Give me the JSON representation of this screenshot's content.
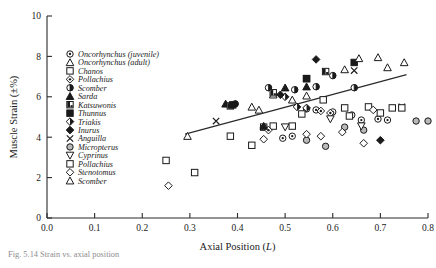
{
  "figure": {
    "caption": "Fig. 5.14  Strain vs. axial position"
  },
  "chart_data": {
    "type": "scatter",
    "title": "",
    "xlabel": "Axial Position (L)",
    "ylabel": "Muscle Strain (±%)",
    "xlim": [
      0.0,
      0.8
    ],
    "ylim": [
      0,
      10
    ],
    "xticks": [
      "0.0",
      "0.1",
      "0.2",
      "0.3",
      "0.4",
      "0.5",
      "0.6",
      "0.7",
      "0.8"
    ],
    "xtick_values": [
      0.0,
      0.1,
      0.2,
      0.3,
      0.4,
      0.5,
      0.6,
      0.7,
      0.8
    ],
    "yticks": [
      "0",
      "2",
      "4",
      "6",
      "8",
      "10"
    ],
    "ytick_values": [
      0,
      2,
      4,
      6,
      8,
      10
    ],
    "grid": false,
    "legend_position": "upper-left-inside",
    "trendline": {
      "label": "linear regression",
      "x_start": 0.29,
      "y_start": 4.15,
      "x_end": 0.755,
      "y_end": 7.1
    },
    "series": [
      {
        "name": "Oncorhynchus (juvenile)",
        "marker": "circle-dot",
        "points": [
          [
            0.495,
            3.95
          ],
          [
            0.515,
            4.05
          ],
          [
            0.545,
            5.4
          ],
          [
            0.565,
            5.35
          ],
          [
            0.6,
            5.25
          ],
          [
            0.64,
            5.1
          ],
          [
            0.66,
            4.85
          ],
          [
            0.695,
            4.9
          ],
          [
            0.715,
            4.85
          ]
        ]
      },
      {
        "name": "Oncorhynchus (adult)",
        "marker": "triangle-open",
        "points": [
          [
            0.295,
            4.05
          ],
          [
            0.43,
            5.5
          ],
          [
            0.475,
            6.1
          ],
          [
            0.545,
            6.05
          ],
          [
            0.625,
            7.35
          ],
          [
            0.695,
            7.95
          ],
          [
            0.75,
            7.7
          ]
        ]
      },
      {
        "name": "Chanos",
        "marker": "square-open",
        "points": [
          [
            0.25,
            2.85
          ],
          [
            0.31,
            2.25
          ],
          [
            0.385,
            4.05
          ],
          [
            0.455,
            4.5
          ],
          [
            0.475,
            4.55
          ],
          [
            0.535,
            5.15
          ],
          [
            0.58,
            5.85
          ],
          [
            0.625,
            5.45
          ],
          [
            0.675,
            5.5
          ],
          [
            0.725,
            5.45
          ]
        ]
      },
      {
        "name": "Pollachius",
        "marker": "diamond-dot",
        "points": [
          [
            0.455,
            4.5
          ],
          [
            0.465,
            4.35
          ],
          [
            0.575,
            5.3
          ],
          [
            0.595,
            5.2
          ]
        ]
      },
      {
        "name": "Scomber",
        "marker": "half-circle",
        "points": [
          [
            0.395,
            5.65
          ],
          [
            0.465,
            6.45
          ],
          [
            0.52,
            6.35
          ],
          [
            0.565,
            6.5
          ],
          [
            0.6,
            7.05
          ],
          [
            0.645,
            6.45
          ]
        ]
      },
      {
        "name": "Sarda",
        "marker": "triangle-filled",
        "points": [
          [
            0.375,
            5.65
          ],
          [
            0.455,
            4.55
          ],
          [
            0.5,
            6.45
          ],
          [
            0.545,
            6.5
          ]
        ]
      },
      {
        "name": "Katsuwonis",
        "marker": "square-half",
        "points": [
          [
            0.385,
            5.55
          ],
          [
            0.475,
            6.2
          ],
          [
            0.545,
            6.9
          ],
          [
            0.585,
            7.25
          ]
        ]
      },
      {
        "name": "Thunnus",
        "marker": "square-filled",
        "points": [
          [
            0.39,
            5.6
          ],
          [
            0.545,
            6.9
          ],
          [
            0.645,
            7.7
          ]
        ]
      },
      {
        "name": "Triakis",
        "marker": "diamond-half",
        "points": [
          [
            0.5,
            6.0
          ],
          [
            0.525,
            5.5
          ],
          [
            0.545,
            5.45
          ]
        ]
      },
      {
        "name": "Inurus",
        "marker": "diamond-filled",
        "points": [
          [
            0.49,
            6.1
          ],
          [
            0.565,
            7.85
          ],
          [
            0.7,
            3.85
          ]
        ]
      },
      {
        "name": "Anguilla",
        "marker": "x-cross",
        "points": [
          [
            0.355,
            4.8
          ],
          [
            0.645,
            7.3
          ],
          [
            0.745,
            5.5
          ]
        ]
      },
      {
        "name": "Micropterus",
        "marker": "circle-grey",
        "points": [
          [
            0.545,
            3.85
          ],
          [
            0.585,
            3.55
          ],
          [
            0.625,
            4.5
          ],
          [
            0.665,
            4.35
          ],
          [
            0.775,
            4.8
          ],
          [
            0.8,
            4.8
          ]
        ]
      },
      {
        "name": "Cyprinus",
        "marker": "triangle-down-open",
        "points": [
          [
            0.5,
            4.5
          ],
          [
            0.595,
            4.9
          ],
          [
            0.66,
            4.55
          ]
        ]
      },
      {
        "name": "Pollachius",
        "marker": "square-open-2",
        "points": [
          [
            0.43,
            3.6
          ],
          [
            0.515,
            4.55
          ],
          [
            0.635,
            5.05
          ],
          [
            0.7,
            5.2
          ],
          [
            0.745,
            5.45
          ]
        ]
      },
      {
        "name": "Stenotomus",
        "marker": "diamond-open",
        "points": [
          [
            0.255,
            1.6
          ],
          [
            0.455,
            3.9
          ],
          [
            0.545,
            4.15
          ],
          [
            0.575,
            4.05
          ],
          [
            0.62,
            4.25
          ],
          [
            0.665,
            3.7
          ],
          [
            0.685,
            5.35
          ]
        ]
      },
      {
        "name": "Scomber",
        "marker": "triangle-open-2",
        "points": [
          [
            0.445,
            5.35
          ],
          [
            0.515,
            5.85
          ],
          [
            0.655,
            7.9
          ],
          [
            0.715,
            7.45
          ]
        ]
      }
    ]
  },
  "legend": {
    "items": [
      {
        "label": "Oncorhynchus (juvenile)",
        "marker": "circle-dot"
      },
      {
        "label": "Oncorhynchus (adult)",
        "marker": "triangle-open"
      },
      {
        "label": "Chanos",
        "marker": "square-open"
      },
      {
        "label": "Pollachius",
        "marker": "diamond-dot"
      },
      {
        "label": "Scomber",
        "marker": "half-circle"
      },
      {
        "label": "Sarda",
        "marker": "triangle-filled"
      },
      {
        "label": "Katsuwonis",
        "marker": "square-half"
      },
      {
        "label": "Thunnus",
        "marker": "square-filled"
      },
      {
        "label": "Triakis",
        "marker": "diamond-half"
      },
      {
        "label": "Inurus",
        "marker": "diamond-filled"
      },
      {
        "label": "Anguilla",
        "marker": "x-cross"
      },
      {
        "label": "Micropterus",
        "marker": "circle-grey"
      },
      {
        "label": "Cyprinus",
        "marker": "triangle-down-open"
      },
      {
        "label": "Pollachius",
        "marker": "square-open-2"
      },
      {
        "label": "Stenotomus",
        "marker": "diamond-open"
      },
      {
        "label": "Scomber",
        "marker": "triangle-open-2"
      }
    ]
  }
}
